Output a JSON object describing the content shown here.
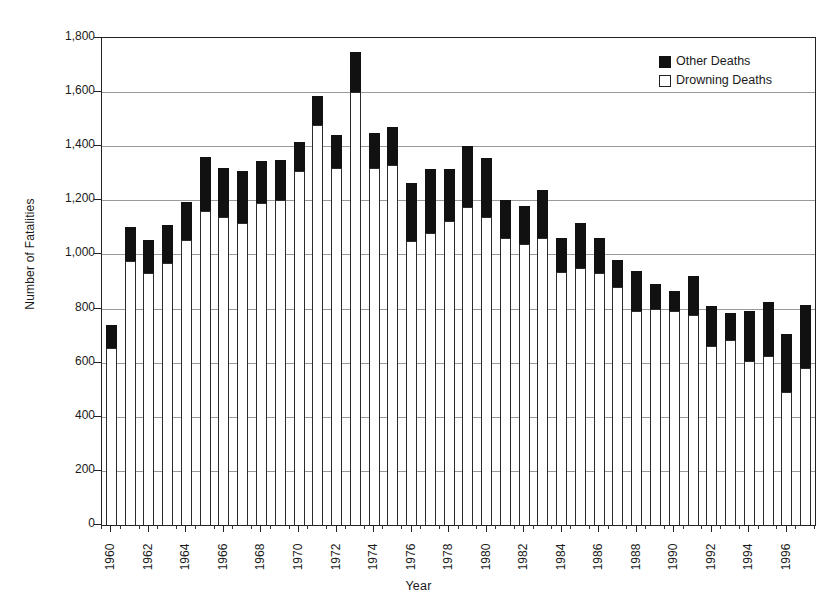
{
  "chart_data": {
    "type": "bar",
    "subtype": "stacked-bar",
    "title": "",
    "xlabel": "Year",
    "ylabel": "Number of Fatalities",
    "ylim": [
      0,
      1800
    ],
    "ytick_values": [
      0,
      200,
      400,
      600,
      800,
      1000,
      1200,
      1400,
      1600,
      1800
    ],
    "ytick_labels": [
      "0",
      "200",
      "400",
      "600",
      "800",
      "1,000",
      "1,200",
      "1,400",
      "1,600",
      "1,800"
    ],
    "grid": true,
    "grid_axis": "y",
    "legend_position": "top-right",
    "categories": [
      1960,
      1961,
      1962,
      1963,
      1964,
      1965,
      1966,
      1967,
      1968,
      1969,
      1970,
      1971,
      1972,
      1973,
      1974,
      1975,
      1976,
      1977,
      1978,
      1979,
      1980,
      1981,
      1982,
      1983,
      1984,
      1985,
      1986,
      1987,
      1988,
      1989,
      1990,
      1991,
      1992,
      1993,
      1994,
      1995,
      1996,
      1997
    ],
    "xtick_labels": [
      "1960",
      "1962",
      "1964",
      "1966",
      "1968",
      "1970",
      "1972",
      "1974",
      "1976",
      "1978",
      "1980",
      "1982",
      "1984",
      "1986",
      "1988",
      "1990",
      "1992",
      "1994",
      "1996"
    ],
    "series": [
      {
        "name": "Drowning Deaths",
        "color": "#ffffff",
        "edge_color": "#2b2b2b",
        "values": [
          655,
          975,
          930,
          970,
          1055,
          1160,
          1140,
          1115,
          1190,
          1200,
          1310,
          1480,
          1320,
          1600,
          1320,
          1330,
          1050,
          1080,
          1125,
          1175,
          1140,
          1060,
          1040,
          1060,
          935,
          950,
          930,
          880,
          790,
          800,
          790,
          775,
          660,
          685,
          605,
          625,
          490,
          580
        ]
      },
      {
        "name": "Other Deaths",
        "color": "#111111",
        "edge_color": "#111111",
        "values": [
          85,
          125,
          125,
          140,
          140,
          200,
          180,
          195,
          155,
          150,
          105,
          105,
          120,
          150,
          130,
          140,
          215,
          235,
          190,
          225,
          215,
          140,
          140,
          180,
          125,
          165,
          130,
          100,
          150,
          90,
          75,
          145,
          150,
          100,
          185,
          200,
          215,
          235
        ]
      }
    ],
    "totals": [
      740,
      1100,
      1055,
      1110,
      1195,
      1360,
      1320,
      1310,
      1345,
      1350,
      1415,
      1585,
      1440,
      1750,
      1450,
      1470,
      1265,
      1315,
      1315,
      1400,
      1355,
      1200,
      1180,
      1240,
      1060,
      1115,
      1060,
      980,
      940,
      890,
      865,
      920,
      810,
      785,
      790,
      825,
      705,
      815
    ]
  },
  "legend": {
    "items": [
      {
        "label": "Other Deaths",
        "style": "filled"
      },
      {
        "label": "Drowning Deaths",
        "style": "open"
      }
    ]
  }
}
